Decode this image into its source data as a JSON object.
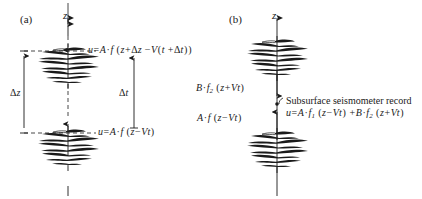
{
  "figure": {
    "type": "seismic-wave-propagation-diagram",
    "background_color": "#ffffff",
    "line_color": "#1a1a1a"
  },
  "panel_a": {
    "label": "(a)",
    "axis_label": "z",
    "axis_direction": "up",
    "upper_wavelet_formula": {
      "lhs": "u",
      "eq": "=",
      "full_text": "u = A · f ( z + Δz − V ( t + Δt ) )",
      "amplitude": "A",
      "function": "f",
      "argument": "z + Δz − V ( t + Δt )"
    },
    "lower_wavelet_formula": {
      "full_text": "u = A · f ( z − Vt )",
      "amplitude": "A",
      "function": "f",
      "argument": "z − Vt"
    },
    "vertical_measure_label": "Δz",
    "time_measure_label": "Δt",
    "wavelet_count": 2,
    "wavelet_positions": [
      "upper",
      "lower"
    ]
  },
  "panel_b": {
    "label": "(b)",
    "axis_label": "z",
    "axis_direction": "up",
    "downgoing_label": {
      "full_text": "B · f₂ ( z + Vt )",
      "amplitude": "B",
      "function": "f₂",
      "argument": "z + Vt"
    },
    "upgoing_label": {
      "full_text": "A · f ( z − Vt )",
      "amplitude": "A",
      "function": "f",
      "argument": "z − Vt"
    },
    "seismometer_annotation": "Subsurface seismometer record",
    "superposition_formula": {
      "full_text": "u = A · f₁ ( z − Vt ) + B · f₂ ( z + Vt )",
      "term_one": "A · f₁ ( z − Vt )",
      "operator": "+",
      "term_two": "B · f₂ ( z + Vt )"
    },
    "wavelet_count": 2,
    "wavelet_positions": [
      "upper",
      "lower"
    ]
  },
  "glyphs": {
    "delta": "Δ",
    "minus": "−",
    "middot": "·",
    "plus": "+"
  }
}
